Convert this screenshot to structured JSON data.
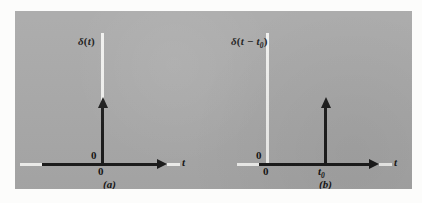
{
  "figure": {
    "background_color": "#a9a9a9",
    "page_color": "#fcfcfb",
    "ink_color": "#1b1b1b",
    "guide_color": "#f2f2f0"
  },
  "panels": [
    {
      "id": "a",
      "caption": "(a)",
      "function_label": "δ(t)",
      "function_label_parts": {
        "delta": "δ",
        "open": "(",
        "variable": "t",
        "close": ")"
      },
      "axis_label_x": "t",
      "origin_tick_upper": "0",
      "origin_tick_lower": "0",
      "impulse_location_label": "0",
      "description": "Unit impulse delta(t) located at the time origin t = 0"
    },
    {
      "id": "b",
      "caption": "(b)",
      "function_label": "δ(t − t₀)",
      "function_label_parts": {
        "delta": "δ",
        "open": "(",
        "variable": "t",
        "operator": "−",
        "shift_base": "t",
        "shift_sub": "0",
        "close": ")"
      },
      "axis_label_x": "t",
      "origin_tick_upper": "0",
      "origin_tick_lower": "0",
      "shift_tick_base": "t",
      "shift_tick_sub": "0",
      "description": "Shifted unit impulse delta(t - t0) located at time t = t0 > 0"
    }
  ]
}
